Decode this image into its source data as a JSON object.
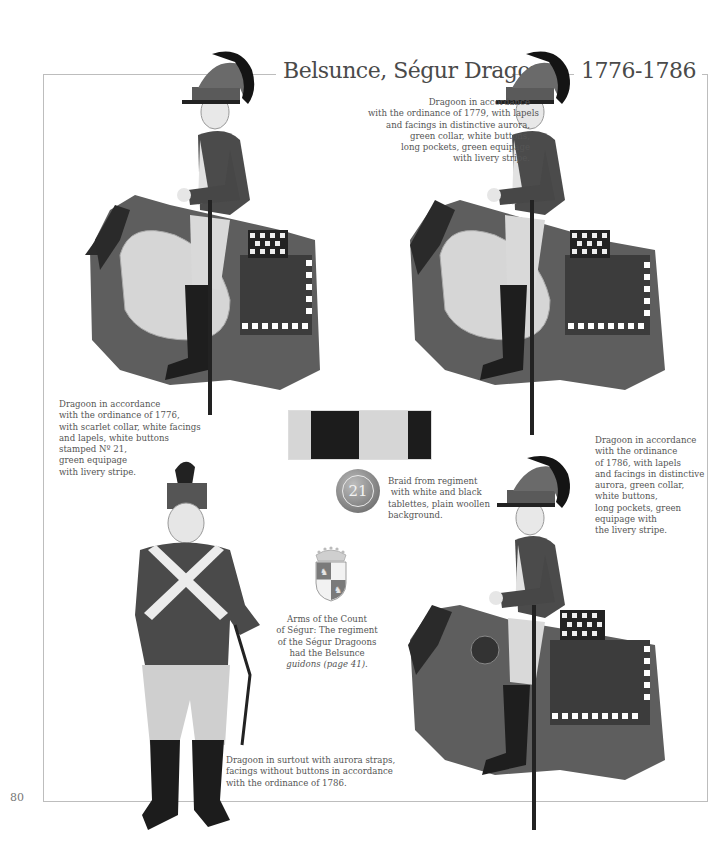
{
  "page": {
    "title": "Belsunce, Ségur Dragons",
    "dates": "1776-1786",
    "page_number": "80"
  },
  "captions": {
    "top_right": {
      "lines": [
        "Dragoon in accordance",
        "with the ordinance of 1779, with lapels",
        "and facings in distinctive aurora,",
        "green collar, white buttons,",
        "long pockets, green equipage",
        "with livery stripe."
      ]
    },
    "left_middle": {
      "lines": [
        "Dragoon in accordance",
        "with the ordinance of 1776,",
        "with scarlet collar, white facings",
        "and lapels, white buttons",
        "stamped Nº 21,",
        "green equipage",
        "with livery stripe."
      ]
    },
    "braid": {
      "lines": [
        "Braid from regiment",
        " with white and black",
        "tablettes, plain woollen",
        "background."
      ]
    },
    "right_middle": {
      "lines": [
        "Dragoon in accordance",
        "with the ordinance",
        "of 1786, with lapels",
        "and facings in distinctive",
        "aurora, green collar,",
        "white buttons,",
        "long pockets, green",
        "equipage with",
        "the livery stripe."
      ]
    },
    "arms": {
      "lines": [
        "Arms of the Count",
        "of Ségur: The regiment",
        "of the Ségur Dragoons",
        "had the Belsunce",
        "guidons (page 41)."
      ]
    },
    "bottom": {
      "lines": [
        "Dragoon in surtout with aurora straps,",
        "facings without buttons in accordance",
        "with the ordinance of 1786."
      ]
    }
  },
  "button": {
    "number": "21"
  },
  "braid_swatch": {
    "segments": [
      {
        "color": "#d6d6d6",
        "width": 22
      },
      {
        "color": "#1c1c1c",
        "width": 48
      },
      {
        "color": "#d6d6d6",
        "width": 49
      },
      {
        "color": "#1c1c1c",
        "width": 23
      }
    ]
  },
  "colors": {
    "frame": "#bdbdbd",
    "coat": "#4d4d4d",
    "horse_cloth": "#555555",
    "sheepskin": "#d4d4d4",
    "boot": "#1e1e1e",
    "helmet": "#5a5a5a",
    "crest": "#141414"
  }
}
